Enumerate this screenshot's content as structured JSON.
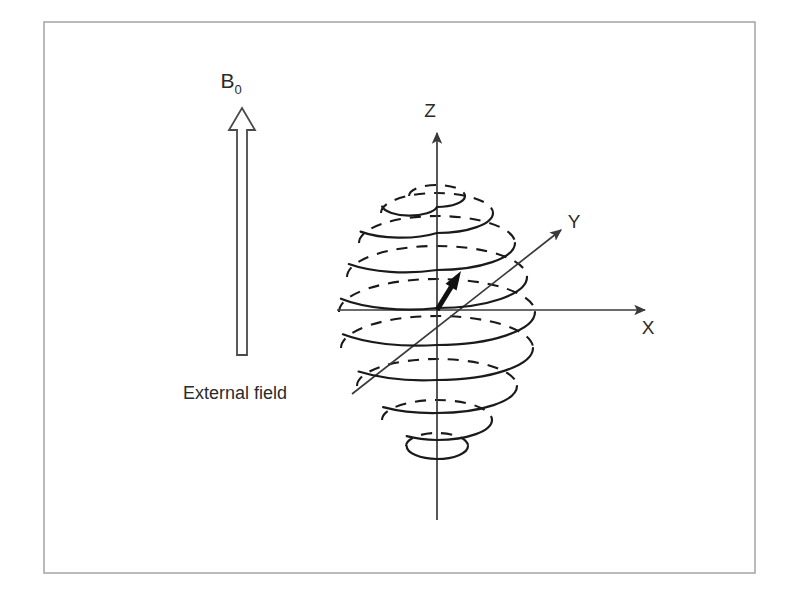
{
  "figure": {
    "background_color": "#ffffff",
    "frame": {
      "name": "figure-border",
      "color": "#a9a9a9",
      "x": 44,
      "y": 22,
      "width": 711,
      "height": 551
    }
  },
  "external_field": {
    "label": "B",
    "label_subscript": "0",
    "caption": "External field",
    "direction": "up",
    "color": "#4a4a4a",
    "arrow": {
      "shaft_x": 242,
      "tip_y": 108,
      "base_y": 355,
      "shaft_width": 10,
      "head_width": 26,
      "head_height": 22
    }
  },
  "coordinate_system": {
    "origin": {
      "x": 437,
      "y": 310
    },
    "color": "#3a3a3a",
    "axes": [
      {
        "name": "z-axis",
        "label": "Z",
        "label_x": 430,
        "label_y": 117,
        "x1": 437,
        "y1": 520,
        "x2": 437,
        "y2": 133,
        "arrow": true
      },
      {
        "name": "x-axis",
        "label": "X",
        "label_x": 648,
        "label_y": 334,
        "x1": 337,
        "y1": 310,
        "x2": 645,
        "y2": 310,
        "arrow": true
      },
      {
        "name": "y-axis",
        "label": "Y",
        "label_x": 574,
        "label_y": 228,
        "x1": 352,
        "y1": 394,
        "x2": 561,
        "y2": 230,
        "arrow": true
      }
    ]
  },
  "magnetization_vector": {
    "name": "magnetization-vector",
    "color": "#111111",
    "x1": 437,
    "y1": 310,
    "x2": 461,
    "y2": 271,
    "width": 5,
    "head_length": 19,
    "head_width": 13
  },
  "precession_spiral": {
    "name": "precession-spiral",
    "color": "#1a1a1a",
    "stroke_width": 2.1,
    "dash_pattern": "11 9",
    "turn_count": 8,
    "description": "Spiral of elliptical precession turns; solid front arcs and dashed rear arcs, widening from the top then narrowing toward the bottom",
    "turns": [
      {
        "cy": 196,
        "rx": 28,
        "ry": 11
      },
      {
        "cy": 213,
        "rx": 56,
        "ry": 20
      },
      {
        "cy": 243,
        "rx": 78,
        "ry": 27
      },
      {
        "cy": 277,
        "rx": 90,
        "ry": 31
      },
      {
        "cy": 312,
        "rx": 98,
        "ry": 33
      },
      {
        "cy": 348,
        "rx": 96,
        "ry": 32
      },
      {
        "cy": 386,
        "rx": 80,
        "ry": 27
      },
      {
        "cy": 420,
        "rx": 55,
        "ry": 20
      },
      {
        "cy": 446,
        "rx": 31,
        "ry": 13
      }
    ]
  }
}
